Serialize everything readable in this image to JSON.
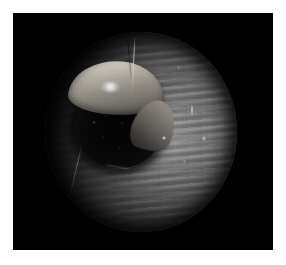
{
  "image": {
    "modality": "endoscopy",
    "view_label": "circular endoscopic field of view",
    "color_mode": "grayscale",
    "canvas": {
      "width": 286,
      "height": 265
    },
    "border": {
      "name": "white-page-margin",
      "color": "#ffffff",
      "left": 13,
      "top": 13,
      "right": 13,
      "bottom": 15
    },
    "frame": {
      "name": "black-video-frame",
      "color": "#000000",
      "x": 13,
      "y": 13,
      "width": 260,
      "height": 237
    },
    "field_of_view": {
      "name": "circular-field-of-view",
      "shape": "circle",
      "center_x": 141,
      "center_y": 132,
      "radius_x": 96,
      "radius_y": 100,
      "background_color": "#1a1a1a"
    },
    "structures": [
      {
        "name": "airway-lumen",
        "description": "dark airway lumen offset up and to the left of centre",
        "color": "#060606",
        "center_x": 117,
        "center_y": 130,
        "width": 85,
        "height": 78
      },
      {
        "name": "bright-tissue-crescent",
        "description": "bright crescent of pale tissue arcing over the top of the lumen",
        "color": "#d3cec3",
        "center_x": 117,
        "center_y": 88,
        "width": 96,
        "height": 54
      },
      {
        "name": "crescent-specular-highlight",
        "description": "small white specular reflection on the pale tissue",
        "color": "#ffffff",
        "center_x": 106,
        "center_y": 86
      },
      {
        "name": "vertical-filament",
        "description": "thin bright filament descending from the top of the field",
        "color": "#e1e1e1",
        "x": 133,
        "y_top": 36,
        "y_bottom": 92
      },
      {
        "name": "tracheal-ring-bands",
        "description": "horizontal cartilage ring banding on the right mucosal wall",
        "color": "#7a7a7a"
      },
      {
        "name": "right-wall-highlight",
        "description": "small vertical specular streak on the right wall",
        "color": "#ffffff",
        "center_x": 192,
        "center_y": 110
      },
      {
        "name": "lower-left-fold-line",
        "description": "faint diagonal mucosal fold in the lower-left quadrant",
        "color": "#4a4a4a"
      }
    ],
    "illumination": {
      "name": "endoscope-light-falloff",
      "brightest_point_x": 168,
      "brightest_point_y": 140,
      "brightest_value": "#8e8e8e",
      "darkest_value": "#000000",
      "direction": "bright at right of centre, falling off toward the left and the circular edge"
    }
  }
}
